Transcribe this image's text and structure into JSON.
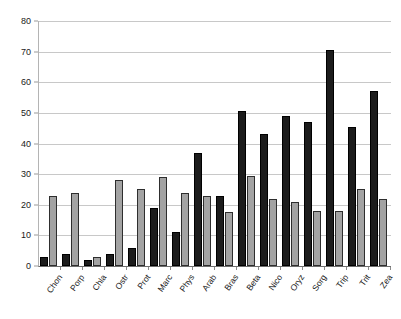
{
  "chart_data": {
    "type": "bar",
    "title": "",
    "subtitle": "",
    "xlabel": "",
    "ylabel": "",
    "ylim": [
      0,
      80
    ],
    "yticks": [
      0,
      10,
      20,
      30,
      40,
      50,
      60,
      70,
      80
    ],
    "grid": true,
    "legend_position": "none",
    "categories": [
      "Chon",
      "Porp",
      "Chla",
      "Ostr",
      "Prot",
      "Marc",
      "Phys",
      "Arab",
      "Bras",
      "Beta",
      "Nico",
      "Oryz",
      "Sorg",
      "Trip",
      "Trit",
      "Zea"
    ],
    "series": [
      {
        "name": "Series 1",
        "color": "#1c1c1c",
        "values": [
          3,
          4,
          2,
          4,
          6,
          19,
          11,
          37,
          23,
          50.5,
          43,
          49,
          47,
          70.5,
          45.5,
          57
        ]
      },
      {
        "name": "Series 2",
        "color": "#a3a3a3",
        "values": [
          23,
          24,
          3,
          28,
          25,
          29,
          24,
          23,
          17.5,
          29.5,
          22,
          21,
          18,
          18,
          25,
          22
        ]
      }
    ]
  },
  "axes": {
    "y_tick_labels": [
      "0",
      "10",
      "20",
      "30",
      "40",
      "50",
      "60",
      "70",
      "80"
    ],
    "x_tick_labels": [
      "Chon",
      "Porp",
      "Chla",
      "Ostr",
      "Prot",
      "Marc",
      "Phys",
      "Arab",
      "Bras",
      "Beta",
      "Nico",
      "Oryz",
      "Sorg",
      "Trip",
      "Trit",
      "Zea"
    ]
  },
  "colors": {
    "series_a": "#1c1c1c",
    "series_b": "#a3a3a3",
    "gridline": "#c8c8c8",
    "axis": "#6e6e6e",
    "background": "#ffffff",
    "text": "#1a1a1a"
  }
}
